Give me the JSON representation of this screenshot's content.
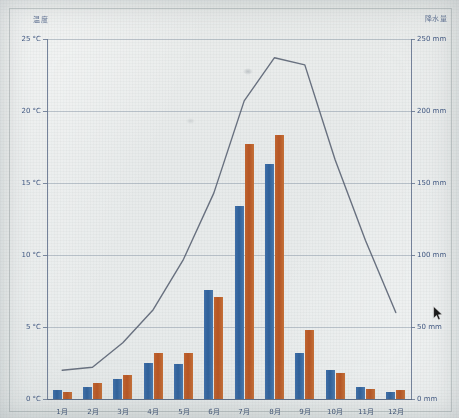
{
  "chart_data": {
    "type": "bar",
    "title": "",
    "categories": [
      "1月",
      "2月",
      "3月",
      "4月",
      "5月",
      "6月",
      "7月",
      "8月",
      "9月",
      "10月",
      "11月",
      "12月"
    ],
    "left_axis": {
      "label": "温度",
      "unit": "°C",
      "ticks": [
        "0 °C",
        "5 °C",
        "10 °C",
        "15 °C",
        "20 °C",
        "25 °C"
      ],
      "tick_values": [
        0,
        5,
        10,
        15,
        20,
        25
      ],
      "range": [
        0,
        25
      ]
    },
    "right_axis": {
      "label": "降水量",
      "unit": "mm",
      "ticks": [
        "0 mm",
        "50 mm",
        "100 mm",
        "150 mm",
        "200 mm",
        "250 mm"
      ],
      "tick_values": [
        0,
        50,
        100,
        150,
        200,
        250
      ],
      "range": [
        0,
        250
      ]
    },
    "grid": true,
    "legend_position": "none",
    "series": [
      {
        "name": "降水量A",
        "kind": "bar",
        "color": "#35639c",
        "axis": "right",
        "unit": "mm",
        "values": [
          6,
          8,
          14,
          25,
          24,
          76,
          134,
          163,
          32,
          20,
          8,
          5
        ]
      },
      {
        "name": "降水量B",
        "kind": "bar",
        "color": "#b85c28",
        "axis": "right",
        "unit": "mm",
        "values": [
          5,
          11,
          17,
          32,
          32,
          71,
          177,
          183,
          48,
          18,
          7,
          6
        ]
      },
      {
        "name": "温度",
        "kind": "line",
        "color": "#5a6476",
        "axis": "left",
        "unit": "°C",
        "values": [
          2.0,
          2.2,
          3.9,
          6.2,
          9.7,
          14.3,
          20.7,
          23.7,
          23.2,
          16.6,
          11.0,
          6.0
        ]
      }
    ]
  },
  "cursor": {
    "name": "mouse-pointer",
    "x": 433,
    "y": 306
  }
}
